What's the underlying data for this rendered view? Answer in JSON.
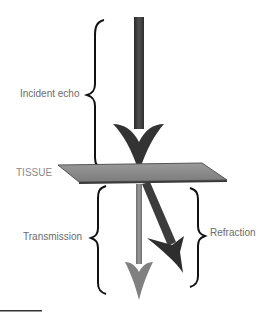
{
  "diagram": {
    "labels": {
      "incident": "Incident echo",
      "tissue": "TISSUE",
      "transmission": "Transmission",
      "refraction": "Refraction"
    },
    "colors": {
      "incident_arrow": "#3a3a3a",
      "tissue_plane": "#8a8a8a",
      "transmission_arrow": "#7d7d7d",
      "refraction_arrow": "#3c3c3c",
      "label_text": "#6b6b6b",
      "brace": "#111111"
    }
  }
}
